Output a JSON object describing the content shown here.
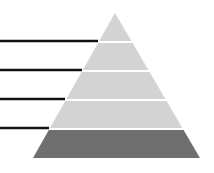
{
  "diagram": {
    "type": "pyramid",
    "levels": 5,
    "apex": [
      115,
      13
    ],
    "base_y": 158,
    "base_left_x": 33,
    "base_right_x": 200,
    "divider_ys": [
      42,
      71,
      100,
      129
    ],
    "divider_gap": 2,
    "colors": {
      "background": "#ffffff",
      "tier_light": "#d3d3d3",
      "tier_base": "#6f6f6f",
      "divider": "#ffffff",
      "leader_line": "#111111"
    },
    "tiers": [
      {
        "id": "tier-1",
        "label": "",
        "shade": "light"
      },
      {
        "id": "tier-2",
        "label": "",
        "shade": "light"
      },
      {
        "id": "tier-3",
        "label": "",
        "shade": "light"
      },
      {
        "id": "tier-4",
        "label": "",
        "shade": "light"
      },
      {
        "id": "tier-5",
        "label": "",
        "shade": "dark"
      }
    ],
    "leader_lines": [
      {
        "y": 41,
        "x_start": 0,
        "x_end": 98
      },
      {
        "y": 70,
        "x_start": 0,
        "x_end": 82
      },
      {
        "y": 99,
        "x_start": 0,
        "x_end": 65
      },
      {
        "y": 128,
        "x_start": 0,
        "x_end": 49
      }
    ]
  }
}
